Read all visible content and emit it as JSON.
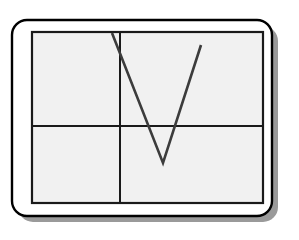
{
  "page": {
    "background_color": "#ffffff",
    "width": 299,
    "height": 240
  },
  "device_frame": {
    "name": "rounded-device-frame",
    "x": 12,
    "y": 20,
    "width": 260,
    "height": 196,
    "corner_radius": 15,
    "fill_color": "#ffffff",
    "stroke_color": "#000000",
    "stroke_width": 2.4
  },
  "shadow": {
    "name": "frame-drop-shadow",
    "offset_x": 6,
    "offset_y": 6,
    "color": "#9a9a9a"
  },
  "drawing_area": {
    "name": "grid-canvas",
    "x": 32,
    "y": 32,
    "width": 231,
    "height": 171,
    "fill_color": "#f1f1f1",
    "stroke_color": "#1a1a1a",
    "stroke_width": 2.2
  },
  "grid": {
    "stroke_color": "#1a1a1a",
    "stroke_width": 2.0,
    "vertical_divider": {
      "name": "grid-divider-vertical",
      "x": 120,
      "y1": 32,
      "y2": 203
    },
    "horizontal_divider": {
      "name": "grid-divider-horizontal",
      "y": 126,
      "x1": 32,
      "x2": 263
    },
    "quadrants": [
      {
        "name": "quadrant-top-left"
      },
      {
        "name": "quadrant-top-right"
      },
      {
        "name": "quadrant-bottom-left"
      },
      {
        "name": "quadrant-bottom-right"
      }
    ]
  },
  "stroke": {
    "name": "v-gesture-stroke",
    "label": "V",
    "stroke_color": "#3c3c3c",
    "stroke_width": 2.6,
    "line_cap": "butt",
    "line_join": "miter",
    "points": [
      {
        "x": 112,
        "y": 33
      },
      {
        "x": 163,
        "y": 163
      },
      {
        "x": 201,
        "y": 45
      }
    ],
    "points_path": "M 112 33 L 163 163 L 201 45"
  }
}
